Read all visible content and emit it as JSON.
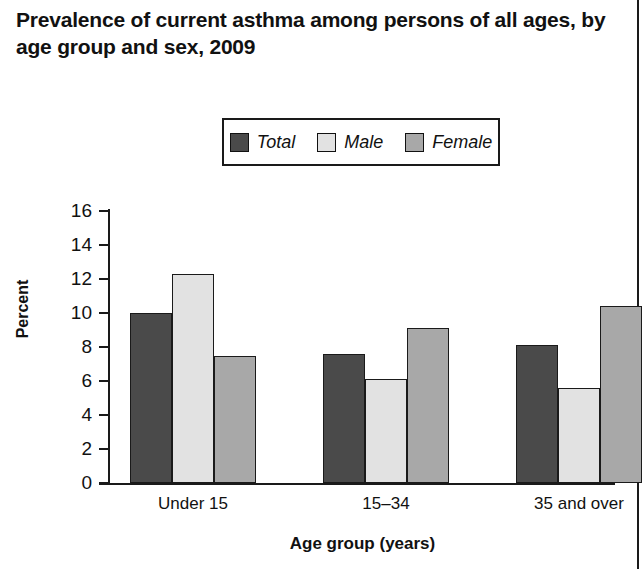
{
  "title": "Prevalence of current asthma among persons of all ages, by age group  and sex, 2009",
  "chart_data": {
    "type": "bar",
    "title": "Prevalence of current asthma among persons of all ages, by age group  and sex, 2009",
    "xlabel": "Age group (years)",
    "ylabel": "Percent",
    "categories": [
      "Under 15",
      "15–34",
      "35 and over"
    ],
    "series": [
      {
        "name": "Total",
        "values": [
          10.0,
          7.6,
          8.1
        ],
        "color": "#4a4a4a"
      },
      {
        "name": "Male",
        "values": [
          12.3,
          6.1,
          5.6
        ],
        "color": "#e2e2e2"
      },
      {
        "name": "Female",
        "values": [
          7.5,
          9.1,
          10.4
        ],
        "color": "#a8a8a8"
      }
    ],
    "ylim": [
      0,
      16
    ],
    "yticks": [
      0,
      2,
      4,
      6,
      8,
      10,
      12,
      14,
      16
    ],
    "ytick_labels": [
      "0",
      "2",
      "4",
      "6",
      "8",
      "10",
      "12",
      "14",
      "16"
    ],
    "grid": false,
    "legend_position": "top-center"
  },
  "legend": {
    "items": [
      {
        "label": "Total",
        "color": "#4a4a4a"
      },
      {
        "label": "Male",
        "color": "#e2e2e2"
      },
      {
        "label": "Female",
        "color": "#a8a8a8"
      }
    ]
  },
  "colors": {
    "total": "#4a4a4a",
    "male": "#e2e2e2",
    "female": "#a8a8a8",
    "axis": "#1a1a1a",
    "background": "#ffffff"
  }
}
